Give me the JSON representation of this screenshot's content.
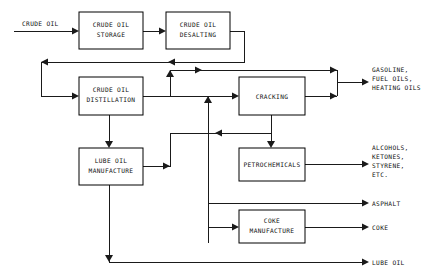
{
  "diagram": {
    "stroke_color": "#1a1a1a",
    "text_color": "#111111",
    "background_color": "#ffffff",
    "process_boxes": [
      {
        "id": "crude-oil-storage",
        "line1": "CRUDE OIL",
        "line2": "STORAGE"
      },
      {
        "id": "crude-oil-desalting",
        "line1": "CRUDE OIL",
        "line2": "DESALTING"
      },
      {
        "id": "crude-oil-distillation",
        "line1": "CRUDE OIL",
        "line2": "DISTILLATION"
      },
      {
        "id": "cracking",
        "line1": "CRACKING",
        "line2": ""
      },
      {
        "id": "lube-oil-manufacture",
        "line1": "LUBE OIL",
        "line2": "MANUFACTURE"
      },
      {
        "id": "petrochemicals",
        "line1": "PETROCHEMICALS",
        "line2": ""
      },
      {
        "id": "coke-manufacture",
        "line1": "COKE",
        "line2": "MANUFACTURE"
      }
    ],
    "input_labels": [
      {
        "id": "crude-oil-input",
        "text": "CRUDE OIL"
      }
    ],
    "output_labels": [
      {
        "id": "gasoline-fuel-heating-oils-output",
        "lines": [
          "GASOLINE,",
          "FUEL OILS,",
          "HEATING OILS"
        ]
      },
      {
        "id": "alcohols-ketones-styrene-output",
        "lines": [
          "ALCOHOLS,",
          "KETONES,",
          "STYRENE,",
          "ETC."
        ]
      },
      {
        "id": "asphalt-output",
        "lines": [
          "ASPHALT"
        ]
      },
      {
        "id": "coke-output",
        "lines": [
          "COKE"
        ]
      },
      {
        "id": "lube-oil-output",
        "lines": [
          "LUBE OIL"
        ]
      }
    ]
  }
}
